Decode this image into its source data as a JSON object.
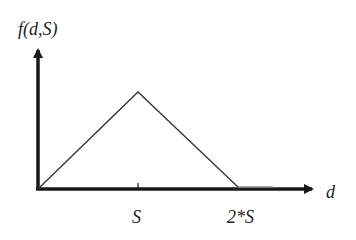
{
  "diagram": {
    "y_axis_label": "f(d,S)",
    "x_axis_label": "d",
    "tick_labels": {
      "s": "S",
      "two_s": "2*S"
    },
    "colors": {
      "axis": "#1a1a1a",
      "curve": "#333333",
      "flat_segment": "#888888"
    },
    "points": [
      {
        "d": "0",
        "f": 0
      },
      {
        "d": "S",
        "f": "max"
      },
      {
        "d": "2*S",
        "f": 0
      }
    ]
  }
}
